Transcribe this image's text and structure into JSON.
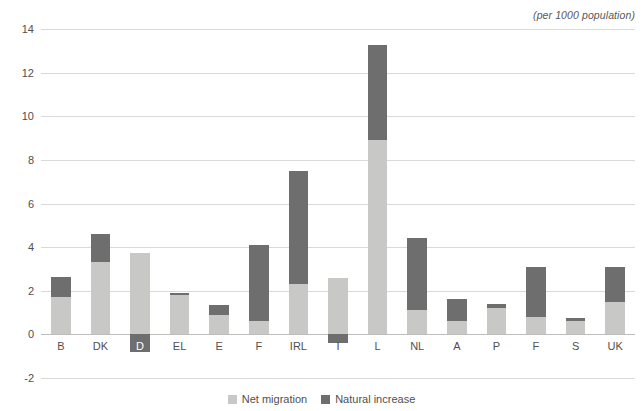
{
  "note": "(per 1000 population)",
  "legend": {
    "items": [
      {
        "label": "Net migration",
        "color": "#c8c8c6",
        "key": "net"
      },
      {
        "label": "Natural increase",
        "color": "#6e6e6e",
        "key": "nat"
      }
    ]
  },
  "chart_data": {
    "type": "bar",
    "stacked": true,
    "title": "",
    "subtitle": "",
    "annotation": "(per 1000 population)",
    "xlabel": "",
    "ylabel": "",
    "ylim": [
      -2,
      14
    ],
    "yticks": [
      14,
      12,
      10,
      8,
      6,
      4,
      2,
      0,
      -2
    ],
    "ytick_labels": [
      "14",
      "12",
      "10",
      "8",
      "6",
      "4",
      "2",
      "0",
      "-2"
    ],
    "grid": true,
    "legend_position": "bottom-center",
    "categories": [
      "B",
      "DK",
      "D",
      "EL",
      "E",
      "F",
      "IRL",
      "I",
      "L",
      "NL",
      "A",
      "P",
      "F",
      "S",
      "UK"
    ],
    "series": [
      {
        "name": "Net migration",
        "color": "#c8c8c6",
        "values": [
          1.7,
          3.3,
          3.75,
          1.8,
          0.9,
          0.6,
          2.3,
          2.6,
          8.9,
          1.1,
          0.6,
          1.2,
          0.8,
          0.6,
          1.5
        ]
      },
      {
        "name": "Natural increase",
        "color": "#6e6e6e",
        "values": [
          0.95,
          1.3,
          -0.8,
          0.1,
          0.45,
          3.5,
          5.2,
          -0.4,
          4.35,
          3.3,
          1.0,
          0.2,
          2.3,
          0.15,
          1.6
        ]
      }
    ],
    "totals": [
      2.65,
      4.6,
      3.75,
      1.9,
      1.35,
      4.1,
      7.5,
      2.6,
      13.25,
      4.4,
      1.6,
      1.4,
      3.1,
      0.75,
      3.1
    ]
  }
}
